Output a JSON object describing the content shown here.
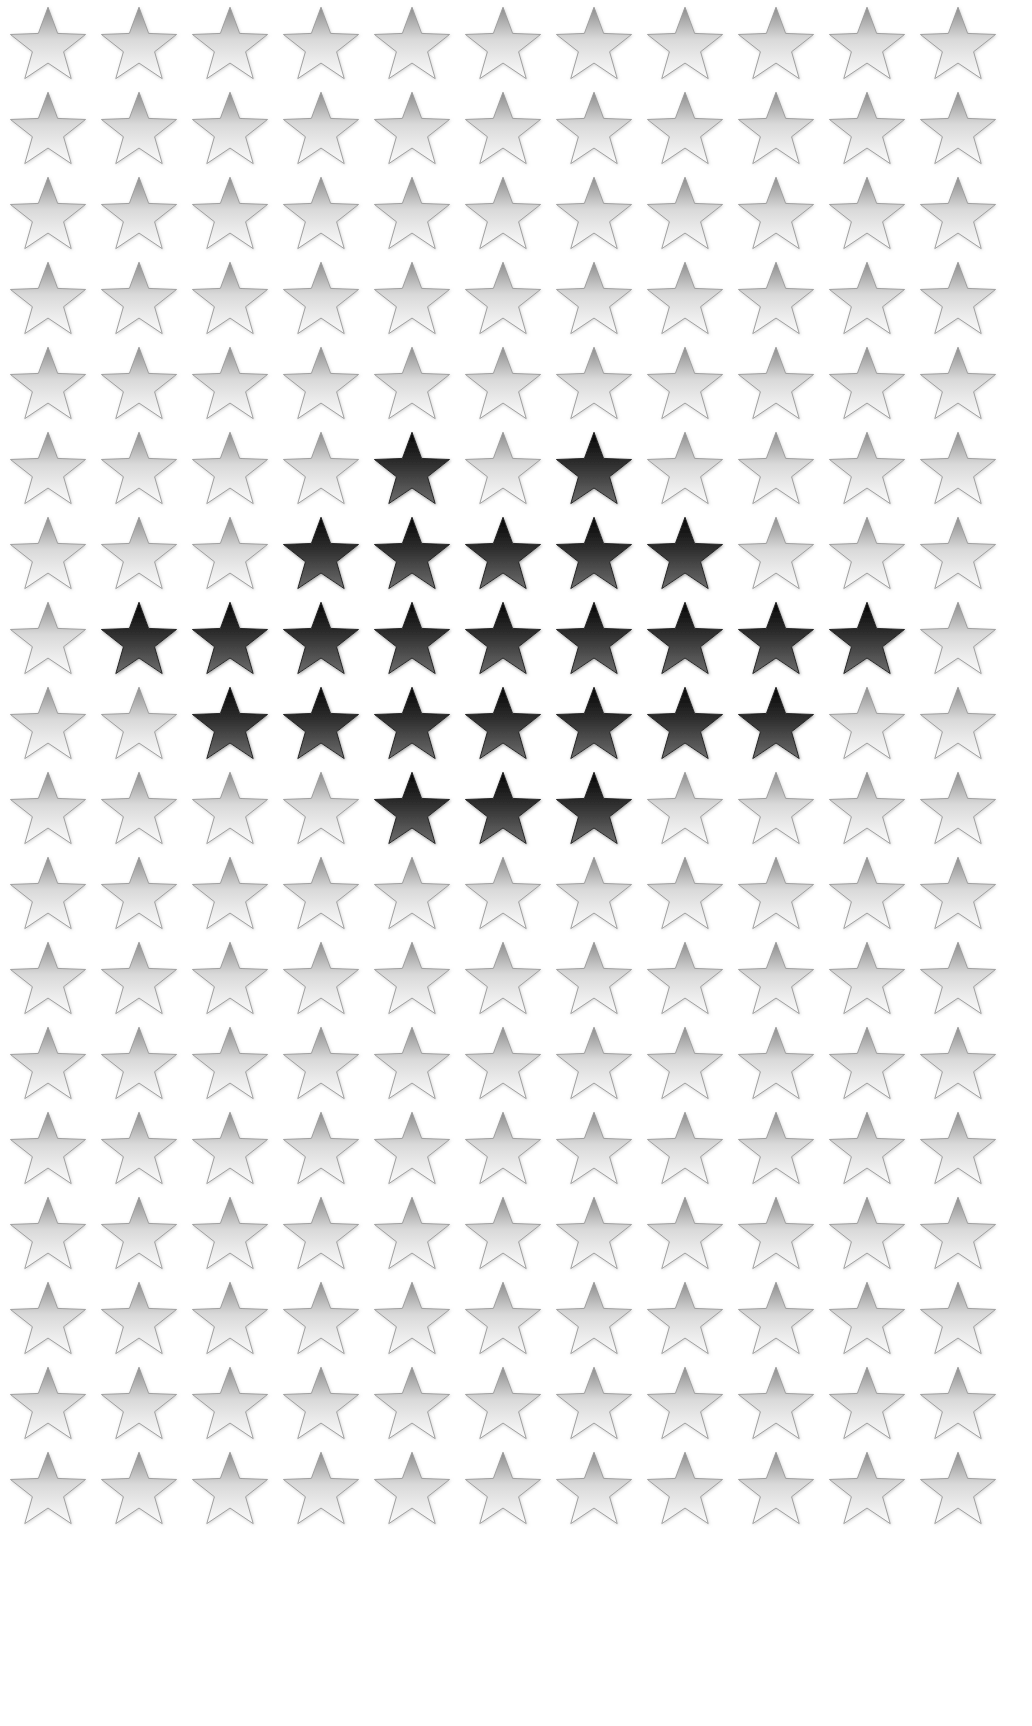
{
  "page": {
    "background_color": "#ffffff",
    "width": 1032,
    "height": 1726
  },
  "grid": {
    "columns": 11,
    "rows": 18,
    "col_spacing": 91,
    "row_spacing": 85,
    "first_col_center_x": 48,
    "first_row_center_y": 45,
    "star_size": 84,
    "icon_name": "five-pointed-star-icon"
  },
  "styles": {
    "light_star": {
      "label": "light star",
      "gradient_top": "#8d8d8d",
      "gradient_mid": "#d9d9d9",
      "gradient_bottom": "#fbfbfb",
      "stroke": "#9a9a9a",
      "shadow": "#c9c9c9"
    },
    "dark_star": {
      "label": "dark star",
      "gradient_top": "#050505",
      "gradient_mid": "#2f2f2f",
      "gradient_bottom": "#6d6d6d",
      "stroke": "#1a1a1a",
      "shadow": "#8a8a8a"
    }
  },
  "dark_star_cells": [
    {
      "row": 6,
      "cols": [
        5,
        7
      ]
    },
    {
      "row": 7,
      "cols": [
        4,
        5,
        6,
        7,
        8
      ]
    },
    {
      "row": 8,
      "cols": [
        2,
        3,
        4,
        5,
        6,
        7,
        8,
        9,
        10
      ]
    },
    {
      "row": 9,
      "cols": [
        3,
        4,
        5,
        6,
        7,
        8,
        9
      ]
    },
    {
      "row": 10,
      "cols": [
        5,
        6,
        7
      ]
    }
  ],
  "counts": {
    "total_stars": 198,
    "dark_stars": 26,
    "light_stars": 172
  }
}
